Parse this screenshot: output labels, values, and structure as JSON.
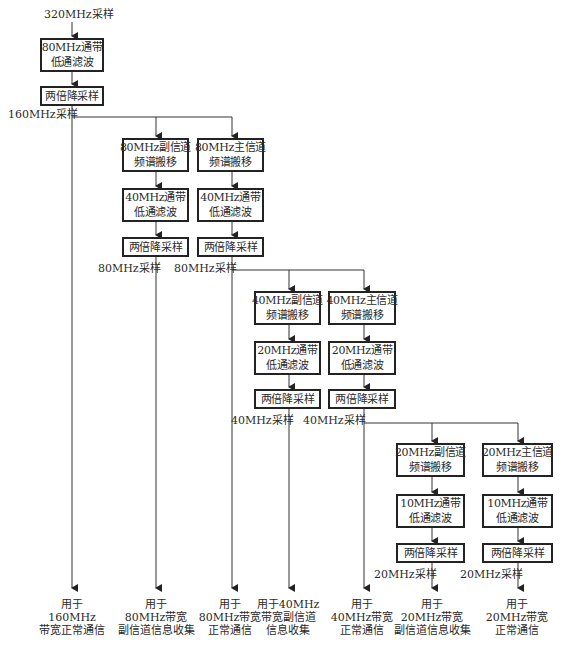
{
  "diagram": {
    "input_label": "320MHz采样",
    "stage0": {
      "filter": [
        "80MHz通带",
        "低通滤波"
      ],
      "decimate": "两倍降采样",
      "rate_label": "160MHz采样"
    },
    "stage1": {
      "secondary": {
        "shift": [
          "80MHz副信道",
          "频谱搬移"
        ],
        "filter": [
          "40MHz通带",
          "低通滤波"
        ],
        "decimate": "两倍降采样",
        "rate_label": "80MHz采样"
      },
      "primary": {
        "shift": [
          "80MHz主信道",
          "频谱搬移"
        ],
        "filter": [
          "40MHz通带",
          "低通滤波"
        ],
        "decimate": "两倍降采样",
        "rate_label": "80MHz采样"
      }
    },
    "stage2": {
      "secondary": {
        "shift": [
          "40MHz副信道",
          "频谱搬移"
        ],
        "filter": [
          "20MHz通带",
          "低通滤波"
        ],
        "decimate": "两倍降采样",
        "rate_label": "40MHz采样"
      },
      "primary": {
        "shift": [
          "40MHz主信道",
          "频谱搬移"
        ],
        "filter": [
          "20MHz通带",
          "低通滤波"
        ],
        "decimate": "两倍降采样",
        "rate_label": "40MHz采样"
      }
    },
    "stage3": {
      "secondary": {
        "shift": [
          "20MHz副信道",
          "频谱搬移"
        ],
        "filter": [
          "10MHz通带",
          "低通滤波"
        ],
        "decimate": "两倍降采样",
        "rate_label": "20MHz采样"
      },
      "primary": {
        "shift": [
          "20MHz主信道",
          "频谱搬移"
        ],
        "filter": [
          "10MHz通带",
          "低通滤波"
        ],
        "decimate": "两倍降采样",
        "rate_label": "20MHz采样"
      }
    },
    "outputs": [
      [
        "用于",
        "160MHz",
        "带宽正常通信"
      ],
      [
        "用于",
        "80MHz带宽",
        "副信道信息收集"
      ],
      [
        "用于",
        "80MHz带宽",
        "正常通信"
      ],
      [
        "用于40MHz",
        "带宽副信道",
        "信息收集"
      ],
      [
        "用于",
        "40MHz带宽",
        "正常通信"
      ],
      [
        "用于",
        "20MHz带宽",
        "副信道信息收集"
      ],
      [
        "用于",
        "20MHz带宽",
        "正常通信"
      ]
    ],
    "colors": {
      "line": "#333333",
      "box_border": "#222222",
      "text": "#2a2a2a",
      "background": "#ffffff"
    }
  }
}
